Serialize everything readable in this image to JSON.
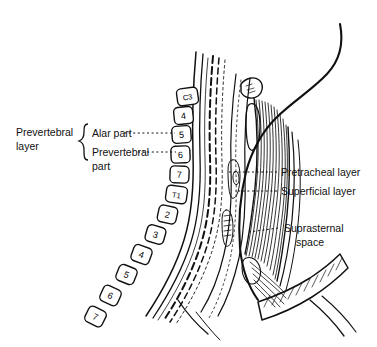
{
  "figure": {
    "ink_color": "#111111",
    "background_color": "#ffffff"
  },
  "labels": {
    "left_group_title": "Prevertebral\nlayer",
    "left_group_title_line1": "Prevertebral",
    "left_group_title_line2": "layer",
    "alar_part": "Alar part",
    "prevertebral_part_line1": "Prevertebral",
    "prevertebral_part_line2": "part",
    "pretracheal_layer": "Pretracheal layer",
    "superficial_layer": "Superficial layer",
    "suprasternal_space_line1": "Suprasternal",
    "suprasternal_space_line2": "space"
  },
  "vertebrae": {
    "cervical": [
      {
        "label": "C3",
        "x": 177,
        "y": 88,
        "w": 21,
        "h": 17,
        "rot": -8,
        "small": true
      },
      {
        "label": "4",
        "x": 174,
        "y": 107,
        "w": 19,
        "h": 17,
        "rot": -6,
        "small": false
      },
      {
        "label": "5",
        "x": 172,
        "y": 126,
        "w": 19,
        "h": 17,
        "rot": -4,
        "small": false
      },
      {
        "label": "6",
        "x": 171,
        "y": 146,
        "w": 19,
        "h": 17,
        "rot": -2,
        "small": false
      },
      {
        "label": "7",
        "x": 170,
        "y": 166,
        "w": 19,
        "h": 17,
        "rot": 2,
        "small": false
      }
    ],
    "thoracic": [
      {
        "label": "T1",
        "x": 166,
        "y": 186,
        "w": 21,
        "h": 17,
        "rot": 8,
        "small": true
      },
      {
        "label": "2",
        "x": 158,
        "y": 206,
        "w": 19,
        "h": 17,
        "rot": 12,
        "small": false
      },
      {
        "label": "3",
        "x": 146,
        "y": 226,
        "w": 19,
        "h": 17,
        "rot": 16,
        "small": false
      },
      {
        "label": "4",
        "x": 132,
        "y": 246,
        "w": 19,
        "h": 17,
        "rot": 20,
        "small": false
      },
      {
        "label": "5",
        "x": 117,
        "y": 266,
        "w": 19,
        "h": 17,
        "rot": 22,
        "small": false
      },
      {
        "label": "6",
        "x": 101,
        "y": 287,
        "w": 19,
        "h": 17,
        "rot": 24,
        "small": false
      },
      {
        "label": "7",
        "x": 86,
        "y": 308,
        "w": 19,
        "h": 17,
        "rot": 26,
        "small": false
      }
    ]
  }
}
